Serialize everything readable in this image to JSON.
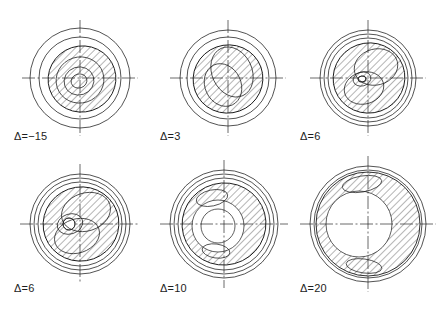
{
  "figure": {
    "type": "engineering-contour-panels",
    "background": "#ffffff",
    "line_color": "#1a1a1a",
    "hatch_color": "#2a2a2a",
    "caption": "",
    "grid": {
      "rows": 2,
      "cols": 3
    }
  },
  "panels": [
    {
      "id": "panel-1",
      "label": "Δ=−15",
      "delta": -15,
      "center": {
        "x": 80,
        "y": 78
      },
      "label_pos": {
        "x": 14,
        "y": 136
      },
      "outer_radius": 50,
      "rings": [
        50,
        41
      ],
      "contours": [
        {
          "name": "contour-outer",
          "rx": 34,
          "ry": 33,
          "cx": 2,
          "cy": 1,
          "rot": -18
        },
        {
          "name": "contour-mid",
          "rx": 24,
          "ry": 23,
          "cx": 0,
          "cy": 2,
          "rot": -18
        },
        {
          "name": "contour-inner",
          "rx": 15,
          "ry": 14,
          "cx": -1,
          "cy": 3,
          "rot": -18
        },
        {
          "name": "contour-core",
          "rx": 8,
          "ry": 7,
          "cx": -1,
          "cy": 3,
          "rot": -18
        }
      ],
      "hatch": {
        "angle": 45,
        "spacing": 5,
        "region": "full-lobe"
      },
      "axis": {
        "h_half": 58,
        "v_half": 58
      }
    },
    {
      "id": "panel-2",
      "label": "Δ=3",
      "delta": 3,
      "center": {
        "x": 228,
        "y": 78
      },
      "label_pos": {
        "x": 160,
        "y": 136
      },
      "outer_radius": 48,
      "rings": [
        48,
        41
      ],
      "contours": [
        {
          "name": "contour-outer",
          "rx": 35,
          "ry": 34,
          "cx": 0,
          "cy": 1,
          "rot": -20
        },
        {
          "name": "contour-s-lobe-upper",
          "rx": 20,
          "ry": 26,
          "cx": 4,
          "cy": -6,
          "rot": -25
        },
        {
          "name": "contour-s-lobe-lower",
          "rx": 18,
          "ry": 22,
          "cx": -5,
          "cy": 7,
          "rot": -25
        }
      ],
      "hatch": {
        "angle": 45,
        "spacing": 5,
        "region": "full-lobe"
      },
      "axis": {
        "h_half": 58,
        "v_half": 58
      }
    },
    {
      "id": "panel-3",
      "label": "Δ=6",
      "delta": 6,
      "center": {
        "x": 368,
        "y": 78
      },
      "label_pos": {
        "x": 300,
        "y": 136
      },
      "outer_radius": 48,
      "rings": [
        48,
        44,
        40
      ],
      "contours": [
        {
          "name": "contour-outer",
          "rx": 36,
          "ry": 35,
          "cx": 1,
          "cy": 0,
          "rot": -20
        },
        {
          "name": "contour-spiral-upper",
          "rx": 22,
          "ry": 18,
          "cx": 8,
          "cy": -11,
          "rot": -15
        },
        {
          "name": "contour-spiral-lower",
          "rx": 20,
          "ry": 16,
          "cx": -4,
          "cy": 10,
          "rot": -15
        },
        {
          "name": "contour-core",
          "rx": 9,
          "ry": 7,
          "cx": -6,
          "cy": 1,
          "rot": -15
        },
        {
          "name": "contour-core-inner",
          "rx": 4,
          "ry": 3,
          "cx": -6,
          "cy": 1,
          "rot": -15
        }
      ],
      "hatch": {
        "angle": 45,
        "spacing": 5,
        "region": "s-spiral"
      },
      "axis": {
        "h_half": 58,
        "v_half": 58
      }
    },
    {
      "id": "panel-4",
      "label": "Δ=6",
      "delta": 6,
      "center": {
        "x": 80,
        "y": 224
      },
      "label_pos": {
        "x": 14,
        "y": 288
      },
      "outer_radius": 50,
      "rings": [
        50,
        46,
        42
      ],
      "contours": [
        {
          "name": "contour-outer",
          "rx": 38,
          "ry": 37,
          "cx": 1,
          "cy": 0,
          "rot": -20
        },
        {
          "name": "contour-spiral-upper",
          "rx": 25,
          "ry": 19,
          "cx": 6,
          "cy": -12,
          "rot": -18
        },
        {
          "name": "contour-spiral-lower",
          "rx": 23,
          "ry": 17,
          "cx": -3,
          "cy": 12,
          "rot": -18
        },
        {
          "name": "contour-core",
          "rx": 13,
          "ry": 10,
          "cx": -10,
          "cy": 0,
          "rot": -18
        },
        {
          "name": "contour-core-inner",
          "rx": 6,
          "ry": 6,
          "cx": -11,
          "cy": 0,
          "rot": 0
        }
      ],
      "hatch": {
        "angle": 45,
        "spacing": 5,
        "region": "s-spiral"
      },
      "axis": {
        "h_half": 60,
        "v_half": 60
      }
    },
    {
      "id": "panel-5",
      "label": "Δ=10",
      "delta": 10,
      "center": {
        "x": 224,
        "y": 224
      },
      "label_pos": {
        "x": 160,
        "y": 288
      },
      "outer_radius": 54,
      "rings": [
        54,
        50,
        46
      ],
      "contours": [
        {
          "name": "contour-outer",
          "rx": 42,
          "ry": 41,
          "cx": 0,
          "cy": 0,
          "rot": -15
        },
        {
          "name": "contour-inner-hole",
          "rx": 26,
          "ry": 26,
          "cx": -6,
          "cy": 2,
          "rot": 0
        },
        {
          "name": "contour-hole-core",
          "rx": 17,
          "ry": 17,
          "cx": -6,
          "cy": 2,
          "rot": 0
        },
        {
          "name": "contour-crescent-tip-upper",
          "rx": 16,
          "ry": 8,
          "cx": -12,
          "cy": -26,
          "rot": -12
        },
        {
          "name": "contour-crescent-tip-lower",
          "rx": 14,
          "ry": 7,
          "cx": -8,
          "cy": 27,
          "rot": 8
        }
      ],
      "hatch": {
        "angle": 45,
        "spacing": 5,
        "region": "crescent"
      },
      "axis": {
        "h_half": 64,
        "v_half": 64
      }
    },
    {
      "id": "panel-6",
      "label": "Δ=20",
      "delta": 20,
      "center": {
        "x": 368,
        "y": 224
      },
      "label_pos": {
        "x": 300,
        "y": 288
      },
      "outer_radius": 58,
      "rings": [
        58,
        54
      ],
      "contours": [
        {
          "name": "contour-outer",
          "rx": 52,
          "ry": 52,
          "cx": 0,
          "cy": 0,
          "rot": 0
        },
        {
          "name": "contour-inner-hole",
          "rx": 33,
          "ry": 33,
          "cx": -9,
          "cy": 0,
          "rot": 0
        },
        {
          "name": "contour-crescent-tip-upper",
          "rx": 20,
          "ry": 8,
          "cx": -6,
          "cy": -40,
          "rot": -10
        },
        {
          "name": "contour-crescent-tip-lower",
          "rx": 18,
          "ry": 7,
          "cx": -4,
          "cy": 42,
          "rot": 8
        }
      ],
      "hatch": {
        "angle": 45,
        "spacing": 5,
        "region": "crescent"
      },
      "axis": {
        "h_half": 68,
        "v_half": 68
      }
    }
  ],
  "chart_data": {
    "type": "contour-panel-series",
    "title": "",
    "variable": "Δ",
    "categories": [
      "Δ=−15",
      "Δ=3",
      "Δ=6",
      "Δ=6",
      "Δ=10",
      "Δ=20"
    ],
    "values": [
      -15,
      3,
      6,
      6,
      10,
      20
    ],
    "xlabel": "",
    "ylabel": "",
    "legend": [],
    "grid": false
  }
}
